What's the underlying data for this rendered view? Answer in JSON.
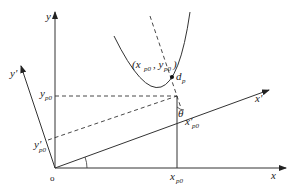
{
  "diagram": {
    "type": "coordinate-rotation-diagram",
    "labels": {
      "origin": "o",
      "x_axis": "x",
      "y_axis": "y",
      "x_prime_axis": "x'",
      "y_prime_axis": "y'",
      "y_p0": "y",
      "y_p0_sub": "p0",
      "x_p0": "x",
      "x_p0_sub": "p0",
      "x_prime_p0": "x'",
      "x_prime_p0_sub": "p0",
      "y_prime_p0": "y'",
      "y_prime_p0_sub": "p0",
      "point_label_open": "(x",
      "point_x_sub": "p0",
      "point_mid": ", y",
      "point_y_sub": "p0",
      "point_label_close": ")",
      "focus": "d",
      "focus_sub": "p",
      "angle": "θ"
    },
    "colors": {
      "stroke": "#333333",
      "background": "#ffffff"
    }
  }
}
